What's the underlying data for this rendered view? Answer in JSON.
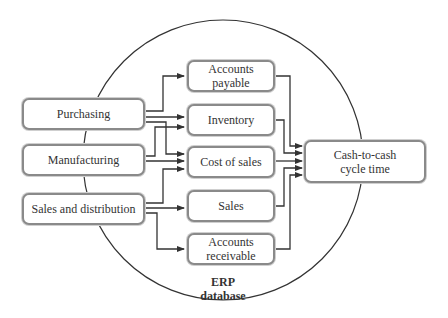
{
  "diagram": {
    "container_label_line1": "ERP",
    "container_label_line2": "database",
    "sources": [
      {
        "id": "purchasing",
        "label": "Purchasing"
      },
      {
        "id": "manufacturing",
        "label": "Manufacturing"
      },
      {
        "id": "sales_distribution",
        "label": "Sales and distribution"
      }
    ],
    "metrics": [
      {
        "id": "accounts_payable",
        "line1": "Accounts",
        "line2": "payable"
      },
      {
        "id": "inventory",
        "line1": "Inventory",
        "line2": ""
      },
      {
        "id": "cost_of_sales",
        "line1": "Cost of sales",
        "line2": ""
      },
      {
        "id": "sales",
        "line1": "Sales",
        "line2": ""
      },
      {
        "id": "accounts_receivable",
        "line1": "Accounts",
        "line2": "receivable"
      }
    ],
    "target": {
      "line1": "Cash-to-cash",
      "line2": "cycle time"
    },
    "edges": [
      [
        "purchasing",
        "accounts_payable"
      ],
      [
        "purchasing",
        "inventory"
      ],
      [
        "purchasing",
        "cost_of_sales"
      ],
      [
        "manufacturing",
        "inventory"
      ],
      [
        "manufacturing",
        "cost_of_sales"
      ],
      [
        "sales_distribution",
        "cost_of_sales"
      ],
      [
        "sales_distribution",
        "sales"
      ],
      [
        "sales_distribution",
        "accounts_receivable"
      ],
      [
        "accounts_payable",
        "target"
      ],
      [
        "inventory",
        "target"
      ],
      [
        "cost_of_sales",
        "target"
      ],
      [
        "sales",
        "target"
      ],
      [
        "accounts_receivable",
        "target"
      ]
    ],
    "colors": {
      "line": "#333333",
      "box_border": "#8a8a8a"
    }
  }
}
